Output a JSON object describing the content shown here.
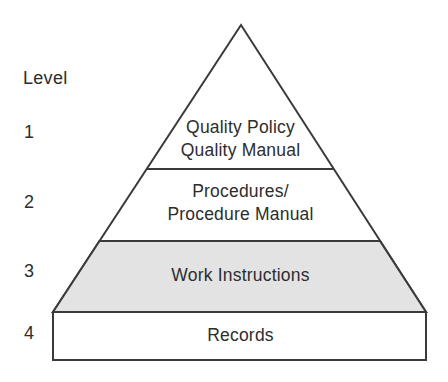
{
  "pyramid": {
    "axis_label": "Level",
    "levels": [
      {
        "number": "1",
        "lines": [
          "Quality Policy",
          "Quality Manual"
        ]
      },
      {
        "number": "2",
        "lines": [
          "Procedures/",
          "Procedure Manual"
        ]
      },
      {
        "number": "3",
        "lines": [
          "Work Instructions"
        ]
      },
      {
        "number": "4",
        "lines": [
          "Records"
        ]
      }
    ],
    "colors": {
      "shaded_level_fill": "#e3e3e3",
      "outline": "#3a3a3a",
      "background": "#ffffff",
      "text": "#2d2d2d"
    }
  }
}
